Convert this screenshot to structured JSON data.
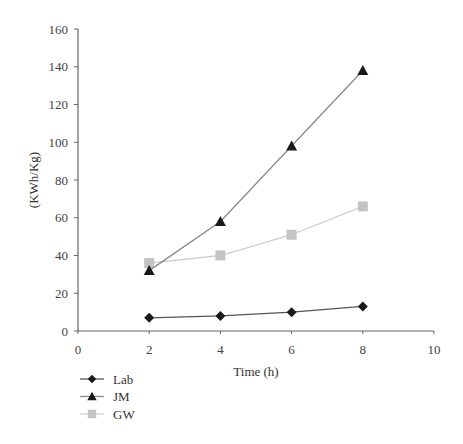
{
  "chart_data": {
    "type": "line",
    "title": "",
    "xlabel": "Time (h)",
    "ylabel": "(KWh/Kg)",
    "xlim": [
      0,
      10
    ],
    "ylim": [
      0,
      160
    ],
    "xticks": [
      0,
      2,
      4,
      6,
      8,
      10
    ],
    "yticks": [
      0,
      20,
      40,
      60,
      80,
      100,
      120,
      140,
      160
    ],
    "grid": false,
    "legend_position": "bottom-left",
    "x": [
      2,
      4,
      6,
      8
    ],
    "series": [
      {
        "name": "Lab",
        "marker": "diamond",
        "color": "#1a1a1a",
        "line_color": "#555555",
        "values": [
          7,
          8,
          10,
          13
        ]
      },
      {
        "name": "JM",
        "marker": "triangle",
        "color": "#1a1a1a",
        "line_color": "#8a8a8a",
        "values": [
          32,
          58,
          98,
          138
        ]
      },
      {
        "name": "GW",
        "marker": "square",
        "color": "#c4c4c4",
        "line_color": "#cfcfcf",
        "values": [
          36,
          40,
          51,
          66
        ]
      }
    ]
  }
}
